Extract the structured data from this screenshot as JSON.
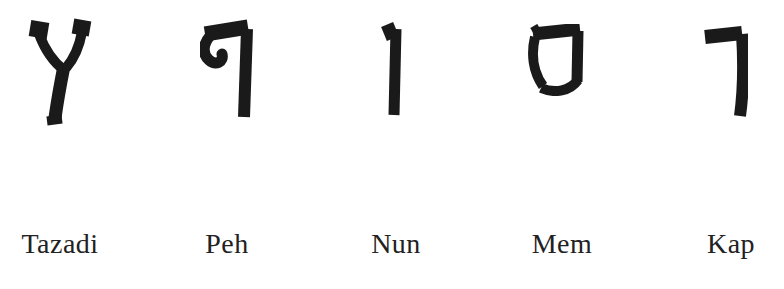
{
  "canvas": {
    "width": 784,
    "height": 289,
    "background": "#ffffff",
    "ink": "#1a1a1a",
    "caption_color": "#222222"
  },
  "letters": [
    {
      "label": "Tazadi",
      "name": "final-tsadi",
      "char": "ץ"
    },
    {
      "label": "Peh",
      "name": "final-peh",
      "char": "ף"
    },
    {
      "label": "Nun",
      "name": "final-nun",
      "char": "ן"
    },
    {
      "label": "Mem",
      "name": "final-mem",
      "char": "ם"
    },
    {
      "label": "Kap",
      "name": "final-kaf",
      "char": "ך"
    }
  ]
}
